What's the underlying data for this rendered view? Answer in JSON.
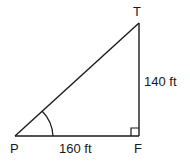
{
  "diagram": {
    "type": "right-triangle",
    "vertices": {
      "P": {
        "label": "P"
      },
      "F": {
        "label": "F"
      },
      "T": {
        "label": "T"
      }
    },
    "sides": {
      "PF": {
        "label": "160 ft"
      },
      "FT": {
        "label": "140 ft"
      }
    },
    "marks": {
      "right_angle_at": "F",
      "angle_arc_at": "P"
    },
    "colors": {
      "stroke": "#1a1a1a",
      "background": "#ffffff"
    }
  }
}
